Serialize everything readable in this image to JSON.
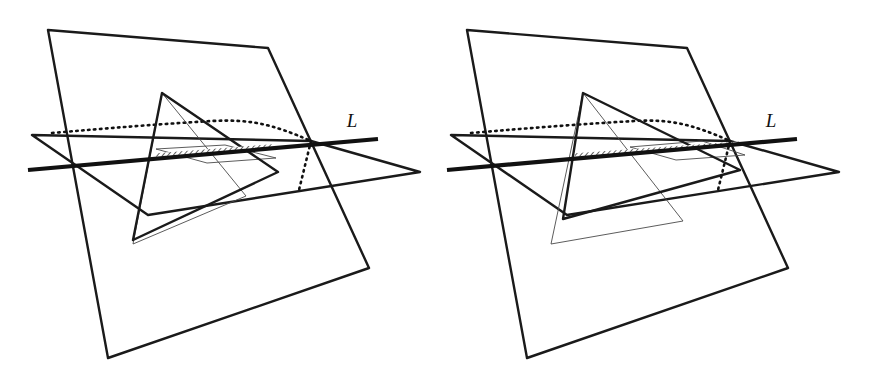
{
  "figure": {
    "background_color": "#ffffff",
    "ink_color": "#1a1a1a",
    "thin_ink_color": "#404040",
    "hatch_color": "#555555",
    "panels": [
      {
        "id": "left-panel",
        "name": "left-figure",
        "label": {
          "text": "L",
          "x": 352,
          "y": 127
        },
        "vertical_plane": {
          "name": "vertical-plane",
          "points": "48,30 268,48 369,268 108,358",
          "stroke_width": 2.4
        },
        "horizontal_plane": {
          "name": "horizontal-plane",
          "points": "32,135 311,141 420,172 148,215",
          "stroke_width": 2.4
        },
        "line_L": {
          "name": "line-L",
          "x1": 28,
          "y1": 170,
          "x2": 378,
          "y2": 139,
          "stroke_width": 4.2
        },
        "bold_triangle": {
          "name": "bold-triangle",
          "points": "162,93 133,240 278,172",
          "stroke_width": 2.4
        },
        "thin_triangle": {
          "name": "thin-triangle",
          "points": "162,93 133,244 246,196",
          "stroke_width": 0.9
        },
        "thin_parallelogram": {
          "name": "thin-parallelogram",
          "points": "156,149 225,145 276,158 207,163",
          "stroke_width": 0.9
        },
        "dashed_curve": {
          "name": "dashed-hidden-curve",
          "path": "M 52,133 C 110,128 160,124 212,121 C 250,119 272,124 311,141",
          "stroke_width": 2.6,
          "dash": "1.5 4.5"
        },
        "dashed_drop": {
          "name": "dashed-drop-line",
          "path": "M 311,141 L 299,190",
          "stroke_width": 2.6,
          "dash": "1.5 4.5"
        },
        "hatch_segment": {
          "name": "hatched-intersection-segment",
          "x1": 156,
          "y1": 155,
          "x2": 272,
          "y2": 146,
          "stroke_width": 3.6
        }
      },
      {
        "id": "right-panel",
        "name": "right-figure",
        "label": {
          "text": "L",
          "x": 771,
          "y": 127
        },
        "vertical_plane": {
          "name": "vertical-plane",
          "points": "467,30 687,48 788,268 527,358",
          "stroke_width": 2.4
        },
        "horizontal_plane": {
          "name": "horizontal-plane",
          "points": "451,135 730,141 839,172 567,215",
          "stroke_width": 2.4
        },
        "line_L": {
          "name": "line-L",
          "x1": 447,
          "y1": 170,
          "x2": 797,
          "y2": 139,
          "stroke_width": 4.2
        },
        "bold_triangle": {
          "name": "bold-triangle",
          "points": "583,93 563,219 740,170",
          "stroke_width": 2.4
        },
        "thin_triangle": {
          "name": "thin-triangle",
          "points": "583,93 551,244 683,221",
          "stroke_width": 0.9
        },
        "thin_parallelogram": {
          "name": "thin-parallelogram",
          "points": "630,147 702,141 745,155 676,160",
          "stroke_width": 0.9
        },
        "dashed_curve": {
          "name": "dashed-hidden-curve",
          "path": "M 471,133 C 530,128 582,124 634,121 C 670,119 692,124 730,141",
          "stroke_width": 2.6,
          "dash": "1.5 4.5"
        },
        "dashed_drop": {
          "name": "dashed-drop-line",
          "path": "M 730,141 L 718,190",
          "stroke_width": 2.6,
          "dash": "1.5 4.5"
        },
        "hatch_segment": {
          "name": "hatched-intersection-segment",
          "x1": 575,
          "y1": 155,
          "x2": 742,
          "y2": 143,
          "stroke_width": 3.6
        }
      }
    ]
  }
}
